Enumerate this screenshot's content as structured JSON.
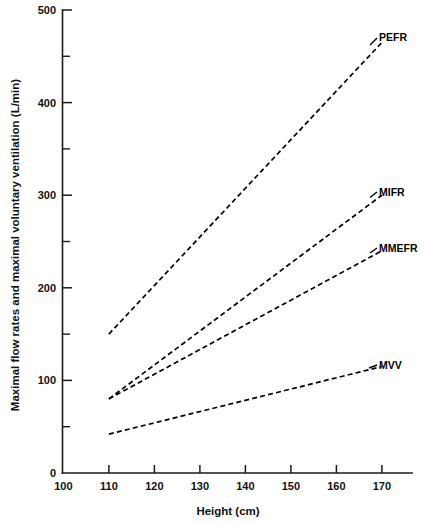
{
  "chart_data": {
    "type": "line",
    "title": "",
    "xlabel": "Height (cm)",
    "ylabel": "Maximal flow rates and maximal voluntary ventilation (L/min)",
    "xlim": [
      100,
      176
    ],
    "ylim": [
      0,
      500
    ],
    "grid": false,
    "legend_position": "right-inline-labels",
    "x_ticks": [
      100,
      110,
      120,
      130,
      140,
      150,
      160,
      170
    ],
    "x_tick_labels": [
      "100",
      "110",
      "120",
      "130",
      "140",
      "150",
      "160",
      "170"
    ],
    "y_ticks": [
      0,
      100,
      200,
      300,
      400,
      500
    ],
    "y_tick_labels": [
      "0",
      "100",
      "200",
      "300",
      "400",
      "500"
    ],
    "y_minor_ticks": [
      50,
      150,
      250,
      350,
      450
    ],
    "x": [
      110,
      170
    ],
    "series": [
      {
        "name": "PEFR",
        "label": "PEFR",
        "values": [
          150,
          465
        ],
        "style": "dashed",
        "color": "#000000"
      },
      {
        "name": "MIFR",
        "label": "MIFR",
        "values": [
          80,
          300
        ],
        "style": "dashed",
        "color": "#000000"
      },
      {
        "name": "MMEFR",
        "label": "MMEFR",
        "values": [
          80,
          240
        ],
        "style": "dashed",
        "color": "#000000"
      },
      {
        "name": "MVV",
        "label": "MVV",
        "values": [
          42,
          115
        ],
        "style": "dashed",
        "color": "#000000"
      }
    ]
  },
  "axis": {
    "y_title": "Maximal flow rates and maximal voluntary ventilation (L/min)",
    "x_title": "Height (cm)"
  }
}
